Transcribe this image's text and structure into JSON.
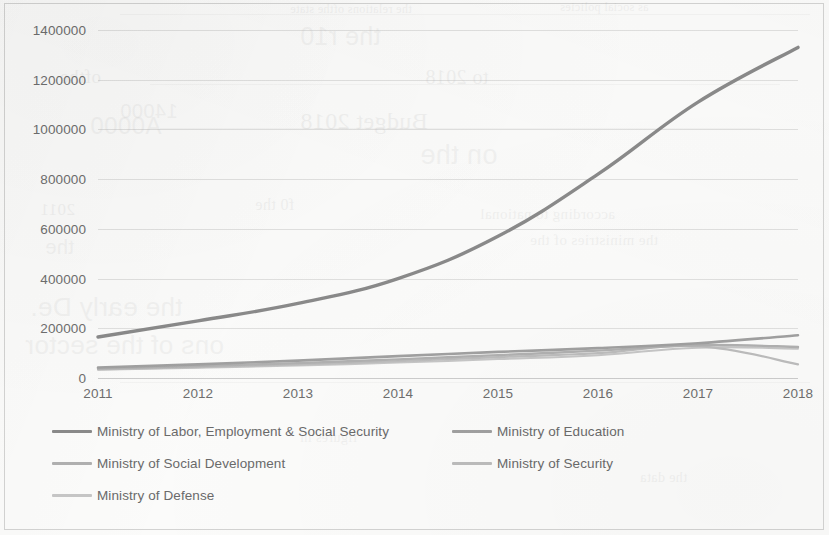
{
  "chart_data": {
    "type": "line",
    "title": "",
    "xlabel": "",
    "ylabel": "",
    "categories": [
      "2011",
      "2012",
      "2013",
      "2014",
      "2015",
      "2016",
      "2017",
      "2018"
    ],
    "x": [
      2011,
      2012,
      2013,
      2014,
      2015,
      2016,
      2017,
      2018
    ],
    "ylim": [
      0,
      1400000
    ],
    "ytick_labels": [
      "0",
      "200000",
      "400000",
      "600000",
      "800000",
      "1000000",
      "1200000",
      "1400000"
    ],
    "yticks": [
      0,
      200000,
      400000,
      600000,
      800000,
      1000000,
      1200000,
      1400000
    ],
    "grid": true,
    "legend_position": "bottom",
    "series": [
      {
        "name": "Ministry of Labor, Employment & Social Security",
        "color": "#8a8a8a",
        "width": 3.4,
        "values": [
          165000,
          230000,
          300000,
          400000,
          570000,
          820000,
          1110000,
          1330000
        ]
      },
      {
        "name": "Ministry of Education",
        "color": "#a0a0a0",
        "width": 2.6,
        "values": [
          42000,
          55000,
          70000,
          88000,
          105000,
          120000,
          140000,
          172000
        ]
      },
      {
        "name": "Ministry of Social Development",
        "color": "#b0b0b0",
        "width": 2.4,
        "values": [
          38000,
          48000,
          60000,
          75000,
          92000,
          110000,
          132000,
          125000
        ]
      },
      {
        "name": "Ministry of Security",
        "color": "#bcbcbc",
        "width": 2.2,
        "values": [
          35000,
          44000,
          55000,
          68000,
          84000,
          100000,
          128000,
          55000
        ]
      },
      {
        "name": "Ministry of Defense",
        "color": "#c6c6c6",
        "width": 2.0,
        "values": [
          33000,
          41000,
          50000,
          62000,
          76000,
          92000,
          122000,
          118000
        ]
      }
    ]
  },
  "legend": {
    "items": [
      {
        "label": "Ministry of Labor, Employment & Social Security",
        "color": "#8a8a8a",
        "row": 0,
        "col": 0
      },
      {
        "label": "Ministry of Education",
        "color": "#a0a0a0",
        "row": 0,
        "col": 1
      },
      {
        "label": "Ministry of Social Development",
        "color": "#b0b0b0",
        "row": 1,
        "col": 0
      },
      {
        "label": "Ministry of Security",
        "color": "#bcbcbc",
        "row": 1,
        "col": 1
      },
      {
        "label": "Ministry of Defense",
        "color": "#c6c6c6",
        "row": 2,
        "col": 0
      }
    ]
  },
  "page": {
    "background_color": "#fbfbfa",
    "border_color": "#787878",
    "text_color": "#6e6e6e",
    "scan_artifacts": true
  }
}
